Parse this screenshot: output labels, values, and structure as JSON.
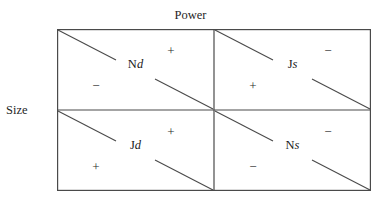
{
  "figure": {
    "type": "two-by-two-matrix",
    "column_axis_label": "Power",
    "row_axis_label": "Size",
    "cells": [
      {
        "id": "top-left",
        "label_prefix": "N",
        "label_suffix": "d",
        "label_full": "Nd",
        "sign_upper_right": "+",
        "sign_lower_left": "−"
      },
      {
        "id": "top-right",
        "label_prefix": "J",
        "label_suffix": "s",
        "label_full": "Js",
        "sign_upper_right": "−",
        "sign_lower_left": "+"
      },
      {
        "id": "bottom-left",
        "label_prefix": "J",
        "label_suffix": "d",
        "label_full": "Jd",
        "sign_upper_right": "+",
        "sign_lower_left": "+"
      },
      {
        "id": "bottom-right",
        "label_prefix": "N",
        "label_suffix": "s",
        "label_full": "Ns",
        "sign_upper_right": "−",
        "sign_lower_left": "−"
      }
    ],
    "colors": {
      "background": "#ffffff",
      "border": "#4a4a4a",
      "diagonal": "#4a4a4a",
      "text": "#1a1a1a"
    }
  }
}
